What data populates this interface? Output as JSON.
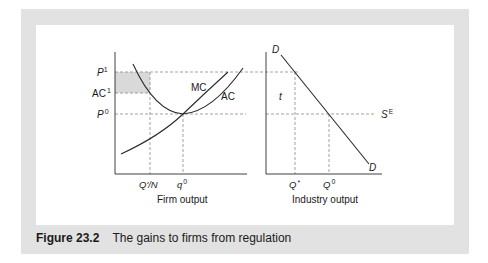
{
  "figure": {
    "number_label": "Figure 23.2",
    "title": "The gains to firms from regulation"
  },
  "left_panel": {
    "xlabel": "Firm output",
    "y_ticks": {
      "p1": {
        "base": "P",
        "sup": "1"
      },
      "ac1": {
        "base": "AC",
        "sup": "1"
      },
      "p0": {
        "base": "P",
        "sup": "0"
      }
    },
    "x_ticks": {
      "qn": "Q'/N",
      "q0": {
        "base": "q",
        "sup": "0"
      }
    },
    "curves": {
      "mc": "MC",
      "ac": "AC"
    }
  },
  "right_panel": {
    "xlabel": "Industry output",
    "x_ticks": {
      "qstar": {
        "base": "Q",
        "sup": "*"
      },
      "q0": {
        "base": "Q",
        "sup": "0"
      }
    },
    "curves": {
      "d_top": "D",
      "d_bottom": "D",
      "supply": {
        "base": "S",
        "sup": "E"
      }
    },
    "tax_label": "t"
  },
  "colors": {
    "frame": "#e2e2e2",
    "shaded_area": "#d9d9d9",
    "line": "#2a2a2a",
    "dash": "#8a8a8a"
  }
}
